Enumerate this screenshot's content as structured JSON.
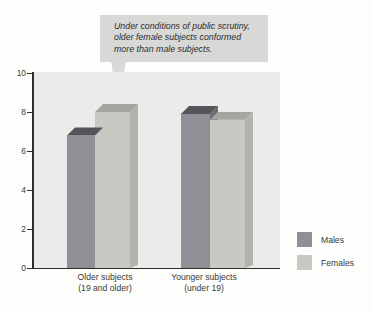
{
  "callout": {
    "lines": [
      "Under conditions of public scrutiny,",
      "older female subjects conformed",
      "more than male subjects."
    ],
    "bg_color": "#d8d8d6"
  },
  "chart_data": {
    "type": "bar",
    "title": "",
    "xlabel": "",
    "ylabel": "",
    "categories": [
      "Older subjects (19 and older)",
      "Younger subjects (under 19)"
    ],
    "category_lines": [
      [
        "Older subjects",
        "(19 and older)"
      ],
      [
        "Younger subjects",
        "(under 19)"
      ]
    ],
    "series": [
      {
        "name": "Males",
        "values": [
          6.8,
          7.9
        ],
        "color": "#8e9095",
        "top_color": "#53555a",
        "side_color": "#6b6d72"
      },
      {
        "name": "Females",
        "values": [
          8.0,
          7.6
        ],
        "color": "#c7c9c3",
        "top_color": "#a3a59f",
        "side_color": "#b1b3ad"
      }
    ],
    "ylim": [
      0,
      10
    ],
    "yticks": [
      0,
      2,
      4,
      6,
      8,
      10
    ],
    "grid": false,
    "legend_position": "right",
    "plot_bg": "#ebebe9",
    "axis_color": "#2e2e2e",
    "style": "3d-oblique"
  }
}
